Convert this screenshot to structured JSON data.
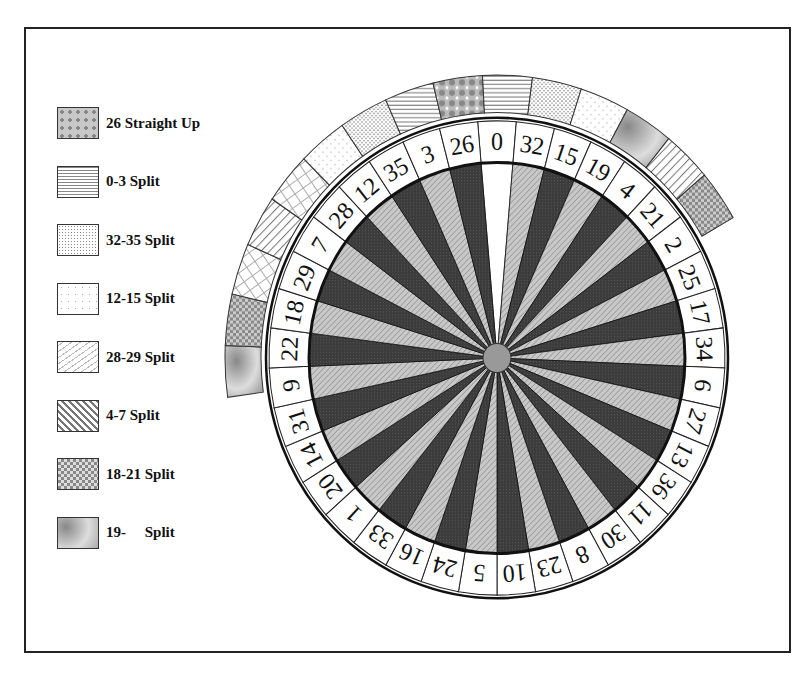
{
  "legend": {
    "items": [
      {
        "label": "26 Straight Up",
        "pattern": "plus-checker"
      },
      {
        "label": "0-3 Split",
        "pattern": "horizontal-lines"
      },
      {
        "label": "32-35 Split",
        "pattern": "fine-dots"
      },
      {
        "label": "12-15 Split",
        "pattern": "sparse-dots"
      },
      {
        "label": "28-29 Split",
        "pattern": "brick-diagonal"
      },
      {
        "label": "4-7 Split",
        "pattern": "diagonal-lines"
      },
      {
        "label": "18-21 Split",
        "pattern": "checker"
      },
      {
        "label": "19-     Split",
        "pattern": "gradient"
      }
    ]
  },
  "wheel": {
    "type": "European roulette",
    "pockets": [
      "0",
      "32",
      "15",
      "19",
      "4",
      "21",
      "2",
      "25",
      "17",
      "34",
      "6",
      "27",
      "13",
      "36",
      "11",
      "30",
      "8",
      "23",
      "10",
      "5",
      "24",
      "16",
      "33",
      "1",
      "20",
      "14",
      "31",
      "9",
      "22",
      "18",
      "29",
      "7",
      "28",
      "12",
      "35",
      "3",
      "26"
    ],
    "colors": {
      "zero": "#ffffff",
      "dark": "#3a3a3a",
      "light": "#b8b8b8",
      "hub": "#999999",
      "line": "#111111"
    },
    "outer_band": [
      "gradient",
      "checker",
      "brick-diagonal",
      "diagonal-lines",
      "brick-diagonal",
      "sparse-dots",
      "fine-dots",
      "horizontal-lines",
      "plus-checker",
      "horizontal-lines",
      "fine-dots",
      "sparse-dots",
      "gradient",
      "diagonal-lines",
      "checker"
    ]
  }
}
